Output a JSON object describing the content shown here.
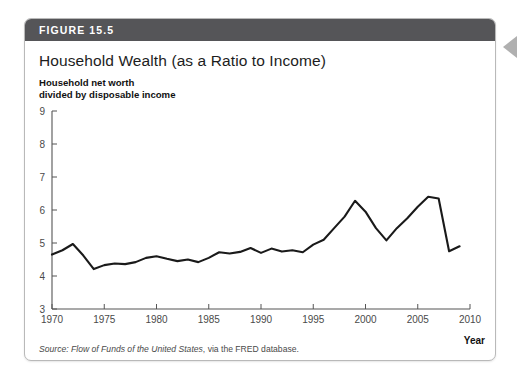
{
  "figure": {
    "banner_label": "FIGURE 15.5",
    "title": "Household Wealth (as a Ratio to Income)",
    "axis_note": "Household net worth\ndivided by disposable income",
    "x_axis_title": "Year",
    "source_prefix": "Source:",
    "source_italic": "Flow of Funds of the United States",
    "source_rest": ", via the FRED database."
  },
  "colors": {
    "banner": "#555558",
    "card_border": "#b9b9b9",
    "line": "#1a1a1a",
    "axis": "#555555",
    "side_arrow": "#b0b0b0",
    "background": "#ffffff"
  },
  "icons": {
    "side_marker": "left-triangle-icon"
  },
  "chart_data": {
    "type": "line",
    "title": "Household Wealth (as a Ratio to Income)",
    "subtitle": "Household net worth divided by disposable income",
    "xlabel": "Year",
    "ylabel": "Household net worth divided by disposable income",
    "xlim": [
      1970,
      2010
    ],
    "ylim": [
      3,
      9
    ],
    "grid": false,
    "legend": null,
    "x_ticks": [
      1970,
      1975,
      1980,
      1985,
      1990,
      1995,
      2000,
      2005,
      2010
    ],
    "y_ticks": [
      3,
      4,
      5,
      6,
      7,
      8,
      9
    ],
    "source": "Flow of Funds of the United States, via the FRED database.",
    "series": [
      {
        "name": "Household net worth / disposable income",
        "x": [
          1970,
          1971,
          1972,
          1973,
          1974,
          1975,
          1976,
          1977,
          1978,
          1979,
          1980,
          1981,
          1982,
          1983,
          1984,
          1985,
          1986,
          1987,
          1988,
          1989,
          1990,
          1991,
          1992,
          1993,
          1994,
          1995,
          1996,
          1997,
          1998,
          1999,
          2000,
          2001,
          2002,
          2003,
          2004,
          2005,
          2006,
          2007,
          2008,
          2009
        ],
        "values": [
          4.65,
          4.78,
          4.97,
          4.62,
          4.21,
          4.33,
          4.38,
          4.36,
          4.42,
          4.55,
          4.6,
          4.52,
          4.45,
          4.5,
          4.42,
          4.55,
          4.72,
          4.68,
          4.73,
          4.85,
          4.7,
          4.83,
          4.74,
          4.78,
          4.72,
          4.95,
          5.1,
          5.45,
          5.8,
          6.28,
          5.95,
          5.45,
          5.08,
          5.45,
          5.75,
          6.1,
          6.4,
          6.35,
          4.75,
          4.9
        ]
      }
    ]
  }
}
